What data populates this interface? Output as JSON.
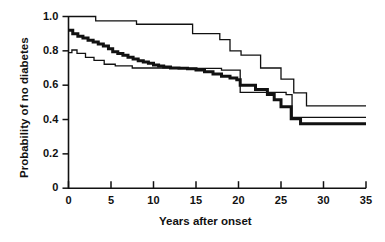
{
  "chart_data": {
    "type": "line",
    "title": "",
    "subtitle": "",
    "xlabel": "Years after onset",
    "ylabel": "Probability of no diabetes",
    "xlim": [
      0,
      35
    ],
    "ylim": [
      0,
      1.0
    ],
    "grid": false,
    "legend": "none",
    "xticks": [
      0,
      5,
      10,
      15,
      20,
      25,
      30,
      35
    ],
    "xtick_labels": [
      "0",
      "5",
      "10",
      "15",
      "20",
      "25",
      "30",
      "35"
    ],
    "yticks": [
      0,
      0.2,
      0.4,
      0.6,
      0.8,
      1.0
    ],
    "ytick_labels": [
      "0",
      "0.2",
      "0.4",
      "0.6",
      "0.8",
      "1.0"
    ],
    "curve_style": "kaplan-meier-step",
    "series": [
      {
        "name": "upper-thin-curve",
        "stroke": "#111111",
        "width": 1.3,
        "points": [
          [
            0.0,
            1.0
          ],
          [
            3.2,
            1.0
          ],
          [
            3.2,
            0.975
          ],
          [
            8.0,
            0.975
          ],
          [
            8.0,
            0.955
          ],
          [
            14.6,
            0.955
          ],
          [
            14.6,
            0.9
          ],
          [
            17.8,
            0.9
          ],
          [
            17.8,
            0.865
          ],
          [
            19.0,
            0.865
          ],
          [
            19.0,
            0.8
          ],
          [
            20.3,
            0.8
          ],
          [
            20.3,
            0.775
          ],
          [
            22.6,
            0.775
          ],
          [
            22.6,
            0.7
          ],
          [
            25.0,
            0.7
          ],
          [
            25.0,
            0.635
          ],
          [
            26.5,
            0.635
          ],
          [
            26.5,
            0.555
          ],
          [
            28.0,
            0.555
          ],
          [
            28.0,
            0.48
          ],
          [
            35.0,
            0.48
          ]
        ]
      },
      {
        "name": "middle-thick-curve",
        "stroke": "#111111",
        "width": 3.0,
        "points": [
          [
            0.0,
            0.92
          ],
          [
            0.5,
            0.9
          ],
          [
            1.1,
            0.885
          ],
          [
            1.7,
            0.875
          ],
          [
            2.3,
            0.862
          ],
          [
            2.9,
            0.852
          ],
          [
            3.5,
            0.84
          ],
          [
            4.1,
            0.828
          ],
          [
            4.7,
            0.812
          ],
          [
            5.2,
            0.795
          ],
          [
            5.8,
            0.785
          ],
          [
            6.4,
            0.775
          ],
          [
            7.0,
            0.762
          ],
          [
            7.6,
            0.752
          ],
          [
            8.2,
            0.742
          ],
          [
            8.8,
            0.735
          ],
          [
            9.4,
            0.728
          ],
          [
            10.0,
            0.718
          ],
          [
            10.6,
            0.712
          ],
          [
            11.2,
            0.706
          ],
          [
            12.0,
            0.7
          ],
          [
            13.0,
            0.698
          ],
          [
            14.0,
            0.696
          ],
          [
            15.0,
            0.688
          ],
          [
            16.0,
            0.678
          ],
          [
            17.0,
            0.665
          ],
          [
            18.0,
            0.652
          ],
          [
            19.0,
            0.642
          ],
          [
            19.8,
            0.632
          ],
          [
            20.2,
            0.622
          ],
          [
            20.2,
            0.6
          ],
          [
            22.0,
            0.6
          ],
          [
            22.0,
            0.575
          ],
          [
            23.4,
            0.575
          ],
          [
            23.4,
            0.545
          ],
          [
            24.2,
            0.545
          ],
          [
            24.2,
            0.515
          ],
          [
            25.0,
            0.515
          ],
          [
            25.0,
            0.475
          ],
          [
            26.2,
            0.475
          ],
          [
            26.2,
            0.405
          ],
          [
            27.3,
            0.405
          ],
          [
            27.3,
            0.375
          ],
          [
            35.0,
            0.375
          ]
        ]
      },
      {
        "name": "lower-thin-curve",
        "stroke": "#111111",
        "width": 1.3,
        "points": [
          [
            0.0,
            0.79
          ],
          [
            0.4,
            0.79
          ],
          [
            0.4,
            0.805
          ],
          [
            1.0,
            0.805
          ],
          [
            1.0,
            0.785
          ],
          [
            2.0,
            0.785
          ],
          [
            2.0,
            0.762
          ],
          [
            3.0,
            0.762
          ],
          [
            3.0,
            0.745
          ],
          [
            4.2,
            0.745
          ],
          [
            4.2,
            0.722
          ],
          [
            5.5,
            0.722
          ],
          [
            5.5,
            0.712
          ],
          [
            7.5,
            0.712
          ],
          [
            7.5,
            0.7
          ],
          [
            12.0,
            0.7
          ],
          [
            12.0,
            0.698
          ],
          [
            18.0,
            0.698
          ],
          [
            18.0,
            0.688
          ],
          [
            20.2,
            0.688
          ],
          [
            20.2,
            0.558
          ],
          [
            25.6,
            0.558
          ],
          [
            25.6,
            0.545
          ],
          [
            26.3,
            0.545
          ],
          [
            26.3,
            0.412
          ],
          [
            35.0,
            0.412
          ]
        ]
      }
    ]
  },
  "axes": {
    "y_axis_label": "Probability of no diabetes",
    "x_axis_label": "Years after onset"
  }
}
